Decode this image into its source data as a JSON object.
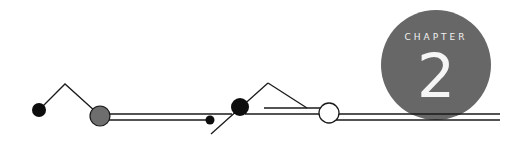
{
  "chapter": {
    "label": "CHAPTER",
    "number": "2"
  },
  "colors": {
    "badge_fill": "#676767",
    "line": "#1a1a1a",
    "node_black": "#0d0d0d",
    "node_gray": "#6e6e6e",
    "node_open": "#ffffff",
    "badge_text": "#f2f2f2"
  }
}
